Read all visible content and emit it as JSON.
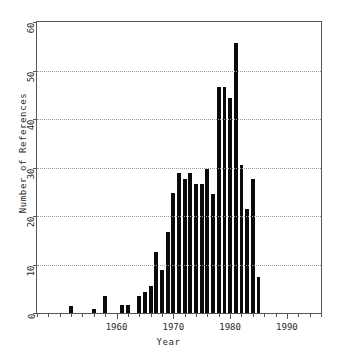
{
  "chart_data": {
    "type": "bar",
    "title": "",
    "xlabel": "Year",
    "ylabel": "Number of References",
    "xlim": [
      1946,
      1996
    ],
    "ylim": [
      0,
      60
    ],
    "grid": true,
    "legend": null,
    "y_ticks": [
      0,
      10,
      20,
      30,
      40,
      50,
      60
    ],
    "y_tick_labels": [
      "0",
      "10",
      "20",
      "30",
      "40",
      "50",
      "60"
    ],
    "x_ticks": [
      1960,
      1970,
      1980,
      1990
    ],
    "x_tick_labels": [
      "1960",
      "1970",
      "1980",
      "1990"
    ],
    "x_minor_tick_step": 2,
    "bar_color": "#0b0b0b",
    "categories": [
      1952,
      1953,
      1954,
      1955,
      1956,
      1957,
      1958,
      1959,
      1960,
      1961,
      1962,
      1963,
      1964,
      1965,
      1966,
      1967,
      1968,
      1969,
      1970,
      1971,
      1972,
      1973,
      1974,
      1975,
      1976,
      1977,
      1978,
      1979,
      1980,
      1981,
      1982,
      1983,
      1984,
      1985,
      1986,
      1987,
      1988,
      1989,
      1990,
      1991
    ],
    "values": [
      1.5,
      0,
      0,
      0,
      0.8,
      0,
      3.6,
      0,
      0,
      1.6,
      1.6,
      0,
      3.5,
      4.4,
      5.6,
      12.6,
      8.8,
      16.7,
      24.7,
      28.8,
      27.7,
      28.8,
      26.7,
      26.7,
      29.7,
      24.6,
      46.5,
      46.5,
      44.4,
      55.6,
      30.5,
      21.5,
      27.6,
      7.5,
      0,
      0,
      0,
      0,
      0,
      0
    ],
    "bars": [
      {
        "year": 1952,
        "value": 1.5
      },
      {
        "year": 1956,
        "value": 0.8
      },
      {
        "year": 1958,
        "value": 3.6
      },
      {
        "year": 1961,
        "value": 1.6
      },
      {
        "year": 1962,
        "value": 1.6
      },
      {
        "year": 1964,
        "value": 3.5
      },
      {
        "year": 1965,
        "value": 4.4
      },
      {
        "year": 1966,
        "value": 5.6
      },
      {
        "year": 1967,
        "value": 12.6
      },
      {
        "year": 1968,
        "value": 8.8
      },
      {
        "year": 1969,
        "value": 16.7
      },
      {
        "year": 1970,
        "value": 24.7
      },
      {
        "year": 1971,
        "value": 28.8
      },
      {
        "year": 1972,
        "value": 27.7
      },
      {
        "year": 1973,
        "value": 28.8
      },
      {
        "year": 1974,
        "value": 26.7
      },
      {
        "year": 1975,
        "value": 26.7
      },
      {
        "year": 1976,
        "value": 29.7
      },
      {
        "year": 1977,
        "value": 24.6
      },
      {
        "year": 1978,
        "value": 46.5
      },
      {
        "year": 1979,
        "value": 46.5
      },
      {
        "year": 1980,
        "value": 44.4
      },
      {
        "year": 1981,
        "value": 55.6
      },
      {
        "year": 1982,
        "value": 30.5
      },
      {
        "year": 1983,
        "value": 21.5
      },
      {
        "year": 1984,
        "value": 27.6
      },
      {
        "year": 1985,
        "value": 7.5
      }
    ]
  }
}
